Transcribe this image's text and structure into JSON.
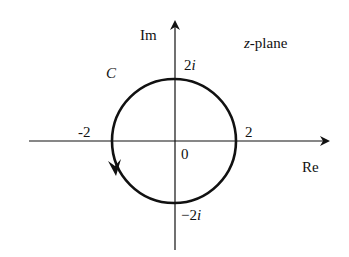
{
  "diagram": {
    "title": "z-plane",
    "title_parts": {
      "var": "z",
      "rest": "-plane"
    },
    "axes": {
      "x_label": "Re",
      "y_label": "Im",
      "origin_label": "0"
    },
    "contour": {
      "name": "C",
      "type": "circle",
      "center": [
        0,
        0
      ],
      "radius": 2,
      "orientation": "counterclockwise"
    },
    "tick_labels": {
      "pos_real": "2",
      "neg_real": "-2",
      "pos_imag": {
        "num": "2",
        "unit": "i"
      },
      "neg_imag": {
        "num": "−2",
        "unit": "i"
      }
    },
    "colors": {
      "stroke": "#111111",
      "background": "#ffffff"
    }
  }
}
